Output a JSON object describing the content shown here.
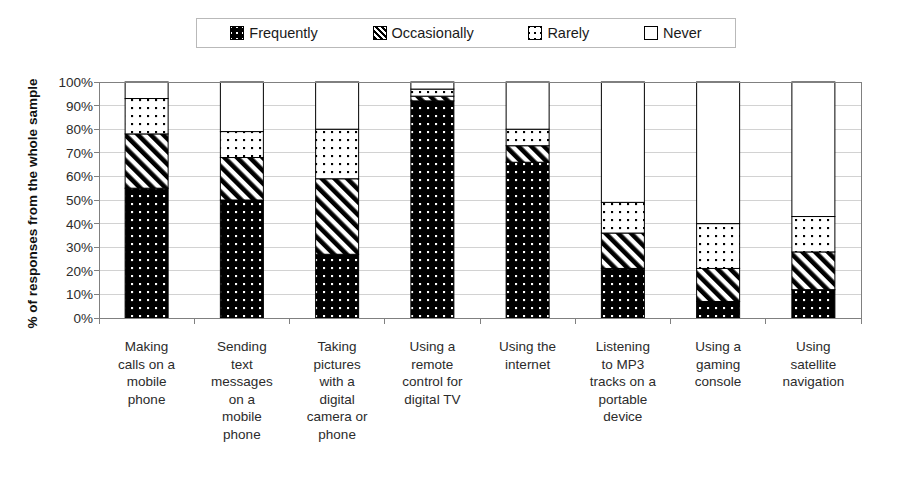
{
  "legend": {
    "position": "top",
    "items": [
      {
        "label": "Frequently",
        "pattern": "black-with-white-dots"
      },
      {
        "label": "Occasionally",
        "pattern": "black-diagonal-stripes"
      },
      {
        "label": "Rarely",
        "pattern": "white-with-black-dots"
      },
      {
        "label": "Never",
        "pattern": "white-empty"
      }
    ]
  },
  "axes": {
    "y_title": "% of responses from the whole sample",
    "y_ticks": [
      "0%",
      "10%",
      "20%",
      "30%",
      "40%",
      "50%",
      "60%",
      "70%",
      "80%",
      "90%",
      "100%"
    ]
  },
  "chart_data": {
    "type": "bar",
    "subtype": "stacked-percentage",
    "title": "",
    "xlabel": "",
    "ylabel": "% of responses from the whole sample",
    "ylim": [
      0,
      100
    ],
    "ytick_step": 10,
    "grid": true,
    "legend_position": "top",
    "categories": [
      "Making calls on a mobile phone",
      "Sending text messages on a mobile phone",
      "Taking pictures with a digital camera or phone",
      "Using a remote control for digital TV",
      "Using the internet",
      "Listening to MP3 tracks on a portable device",
      "Using a gaming console",
      "Using satellite navigation"
    ],
    "category_lines": [
      [
        "Making",
        "calls on a",
        "mobile",
        "phone"
      ],
      [
        "Sending",
        "text",
        "messages",
        "on a",
        "mobile",
        "phone"
      ],
      [
        "Taking",
        "pictures",
        "with a",
        "digital",
        "camera or",
        "phone"
      ],
      [
        "Using a",
        "remote",
        "control for",
        "digital TV"
      ],
      [
        "Using the",
        "internet"
      ],
      [
        "Listening",
        "to MP3",
        "tracks on a",
        "portable",
        "device"
      ],
      [
        "Using a",
        "gaming",
        "console"
      ],
      [
        "Using",
        "satellite",
        "navigation"
      ]
    ],
    "series": [
      {
        "name": "Frequently",
        "values": [
          55,
          50,
          27,
          92,
          66,
          21,
          7,
          12
        ]
      },
      {
        "name": "Occasionally",
        "values": [
          23,
          18,
          32,
          2,
          7,
          15,
          14,
          16
        ]
      },
      {
        "name": "Rarely",
        "values": [
          15,
          11,
          21,
          3,
          7,
          13,
          19,
          15
        ]
      },
      {
        "name": "Never",
        "values": [
          7,
          21,
          20,
          3,
          20,
          51,
          60,
          57
        ]
      }
    ]
  }
}
